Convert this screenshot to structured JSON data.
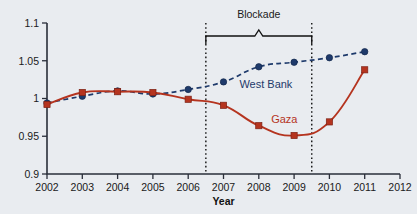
{
  "chart_data": {
    "type": "line",
    "title": "",
    "xlabel": "Year",
    "ylabel": "",
    "x": [
      2002,
      2003,
      2004,
      2005,
      2006,
      2007,
      2008,
      2009,
      2010,
      2011
    ],
    "xlim": [
      2002,
      2012
    ],
    "ylim": [
      0.9,
      1.1
    ],
    "xticks": [
      "2002",
      "2003",
      "2004",
      "2005",
      "2006",
      "2007",
      "2008",
      "2009",
      "2010",
      "2011",
      "2012"
    ],
    "yticks": [
      "0.9",
      "0.95",
      "1",
      "1.05",
      "1.1"
    ],
    "ytick_values": [
      0.9,
      0.95,
      1.0,
      1.05,
      1.1
    ],
    "grid": false,
    "legend_position": "inline-labels",
    "series": [
      {
        "name": "West Bank",
        "color": "#1e3a6b",
        "linestyle": "dashed",
        "marker": "circle",
        "values": [
          0.994,
          1.003,
          1.01,
          1.006,
          1.012,
          1.022,
          1.042,
          1.048,
          1.054,
          1.062
        ],
        "label_x": 2007.45,
        "label_y": 1.014
      },
      {
        "name": "Gaza",
        "color": "#b5341f",
        "linestyle": "solid",
        "marker": "square",
        "values": [
          0.992,
          1.008,
          1.009,
          1.008,
          0.999,
          0.991,
          0.964,
          0.951,
          0.969,
          1.038
        ],
        "label_x": 2008.35,
        "label_y": 0.968
      }
    ],
    "annotations": [
      {
        "name": "blockade",
        "text": "Blockade",
        "type": "brace-span",
        "x_start": 2006.5,
        "x_end": 2009.5,
        "text_y": 1.112
      }
    ]
  }
}
